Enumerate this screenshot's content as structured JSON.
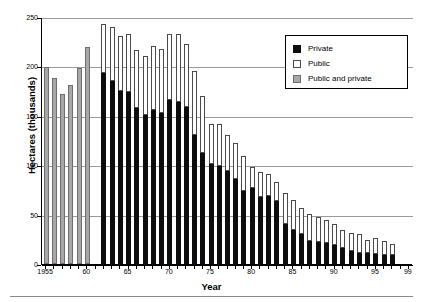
{
  "chart_data": {
    "type": "bar",
    "subtype": "stacked-vertical",
    "title": "",
    "xlabel": "Year",
    "ylabel": "Hectares (thousands)",
    "ylim": [
      0,
      250
    ],
    "yticks": [
      0,
      50,
      100,
      150,
      200,
      250
    ],
    "grid": true,
    "legend_position": "top-right",
    "legend": [
      "Private",
      "Public",
      "Public and private"
    ],
    "colors": {
      "private": "#0d0d0d",
      "public": "#ffffff",
      "public_and_private": "#a8a8a8",
      "gridline": "#9a9a9a",
      "axis": "#000000"
    },
    "categories": [
      1955,
      1956,
      1957,
      1958,
      1959,
      1960,
      1961,
      1962,
      1963,
      1964,
      1965,
      1966,
      1967,
      1968,
      1969,
      1970,
      1971,
      1972,
      1973,
      1974,
      1975,
      1976,
      1977,
      1978,
      1979,
      1980,
      1981,
      1982,
      1983,
      1984,
      1985,
      1986,
      1987,
      1988,
      1989,
      1990,
      1991,
      1992,
      1993,
      1994,
      1995,
      1996,
      1997,
      1998,
      1999
    ],
    "xtick_labels": [
      "1955",
      "60",
      "65",
      "70",
      "75",
      "80",
      "85",
      "90",
      "95",
      "99"
    ],
    "xtick_years": [
      1955,
      1960,
      1965,
      1970,
      1975,
      1980,
      1985,
      1990,
      1995,
      1999
    ],
    "series": [
      {
        "name": "Private",
        "values": [
          null,
          null,
          null,
          null,
          null,
          null,
          null,
          193,
          185,
          175,
          174,
          158,
          151,
          156,
          153,
          166,
          164,
          159,
          131,
          112,
          101,
          99,
          94,
          86,
          74,
          77,
          68,
          69,
          64,
          40,
          34,
          30,
          23,
          22,
          21,
          19,
          16,
          13,
          11,
          11,
          10,
          9,
          null,
          null,
          null
        ]
      },
      {
        "name": "Public",
        "values": [
          null,
          null,
          null,
          null,
          null,
          null,
          null,
          50,
          55,
          56,
          59,
          60,
          60,
          65,
          65,
          67,
          69,
          64,
          64,
          58,
          41,
          43,
          47,
          45,
          48,
          32,
          30,
          24,
          27,
          32,
          31,
          27,
          21,
          25,
          23,
          25,
          18,
          19,
          19,
          13,
          15,
          11,
          null,
          null,
          null
        ]
      },
      {
        "name": "Public and private",
        "values": [
          199,
          188,
          172,
          181,
          198,
          220,
          0,
          null,
          null,
          null,
          null,
          null,
          null,
          null,
          null,
          null,
          null,
          null,
          null,
          null,
          null,
          null,
          null,
          null,
          null,
          null,
          null,
          null,
          null,
          null,
          null,
          null,
          null,
          null,
          null,
          null,
          null,
          null,
          null,
          null,
          null,
          null,
          null,
          null,
          null
        ]
      }
    ],
    "bars": [
      {
        "year": 1955,
        "both": 199
      },
      {
        "year": 1956,
        "both": 188
      },
      {
        "year": 1957,
        "both": 172
      },
      {
        "year": 1958,
        "both": 181
      },
      {
        "year": 1959,
        "both": 198
      },
      {
        "year": 1960,
        "both": 220
      },
      {
        "year": 1961,
        "both": 0
      },
      {
        "year": 1962,
        "private": 193,
        "public": 50,
        "total": 243
      },
      {
        "year": 1963,
        "private": 185,
        "public": 55,
        "total": 240
      },
      {
        "year": 1964,
        "private": 175,
        "public": 56,
        "total": 231
      },
      {
        "year": 1965,
        "private": 174,
        "public": 59,
        "total": 233
      },
      {
        "year": 1966,
        "private": 158,
        "public": 59,
        "total": 217
      },
      {
        "year": 1967,
        "private": 151,
        "public": 60,
        "total": 211
      },
      {
        "year": 1968,
        "private": 156,
        "public": 65,
        "total": 221
      },
      {
        "year": 1969,
        "private": 153,
        "public": 65,
        "total": 218
      },
      {
        "year": 1970,
        "private": 166,
        "public": 67,
        "total": 233
      },
      {
        "year": 1971,
        "private": 164,
        "public": 69,
        "total": 233
      },
      {
        "year": 1972,
        "private": 159,
        "public": 64,
        "total": 223
      },
      {
        "year": 1973,
        "private": 131,
        "public": 64,
        "total": 195
      },
      {
        "year": 1974,
        "private": 112,
        "public": 58,
        "total": 170
      },
      {
        "year": 1975,
        "private": 101,
        "public": 41,
        "total": 142
      },
      {
        "year": 1976,
        "private": 99,
        "public": 43,
        "total": 142
      },
      {
        "year": 1977,
        "private": 94,
        "public": 37,
        "total": 131
      },
      {
        "year": 1978,
        "private": 86,
        "public": 36,
        "total": 122
      },
      {
        "year": 1979,
        "private": 74,
        "public": 35,
        "total": 109
      },
      {
        "year": 1980,
        "private": 77,
        "public": 21,
        "total": 98
      },
      {
        "year": 1981,
        "private": 68,
        "public": 25,
        "total": 93
      },
      {
        "year": 1982,
        "private": 69,
        "public": 22,
        "total": 91
      },
      {
        "year": 1983,
        "private": 64,
        "public": 19,
        "total": 83
      },
      {
        "year": 1984,
        "private": 40,
        "public": 32,
        "total": 72
      },
      {
        "year": 1985,
        "private": 34,
        "public": 31,
        "total": 65
      },
      {
        "year": 1986,
        "private": 30,
        "public": 27,
        "total": 57
      },
      {
        "year": 1987,
        "private": 23,
        "public": 28,
        "total": 51
      },
      {
        "year": 1988,
        "private": 22,
        "public": 26,
        "total": 48
      },
      {
        "year": 1989,
        "private": 21,
        "public": 24,
        "total": 45
      },
      {
        "year": 1990,
        "private": 19,
        "public": 22,
        "total": 41
      },
      {
        "year": 1991,
        "private": 16,
        "public": 18,
        "total": 34
      },
      {
        "year": 1992,
        "private": 13,
        "public": 18,
        "total": 31
      },
      {
        "year": 1993,
        "private": 11,
        "public": 19,
        "total": 30
      },
      {
        "year": 1994,
        "private": 11,
        "public": 13,
        "total": 24
      },
      {
        "year": 1995,
        "private": 10,
        "public": 16,
        "total": 26
      },
      {
        "year": 1996,
        "private": 9,
        "public": 14,
        "total": 23
      },
      {
        "year": 1997,
        "private": 9,
        "public": 11,
        "total": 20
      }
    ]
  },
  "axis": {
    "y_title": "Hectares (thousands)",
    "x_title": "Year",
    "y_tick_labels": [
      "250",
      "200",
      "150",
      "100",
      "50",
      "0"
    ]
  },
  "legend": {
    "items": [
      {
        "label": "Private",
        "swatch": "private"
      },
      {
        "label": "Public",
        "swatch": "public"
      },
      {
        "label": "Public and private",
        "swatch": "both"
      }
    ]
  }
}
